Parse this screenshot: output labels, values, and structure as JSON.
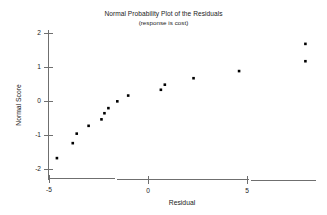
{
  "chart_data": {
    "type": "scatter",
    "title": "Normal Probability Plot of the Residuals",
    "subtitle": "(response is cost)",
    "xlabel": "Residual",
    "ylabel": "Normal Score",
    "xlim": [
      -5.6,
      9.0
    ],
    "ylim": [
      -2.15,
      2.15
    ],
    "xticks": [
      -5,
      0,
      5
    ],
    "xtick_labels": [
      "-5",
      "0",
      "5"
    ],
    "yticks": [
      -2,
      -1,
      0,
      1,
      2
    ],
    "ytick_labels": [
      "-2",
      "-1",
      "0",
      "1",
      "2"
    ],
    "grid": false,
    "legend": "none",
    "marker": "square",
    "marker_color": "#000000",
    "axis_color": "#6f6f6f",
    "points": [
      {
        "x": -4.6,
        "y": -1.68
      },
      {
        "x": -3.8,
        "y": -1.24
      },
      {
        "x": -3.6,
        "y": -0.96
      },
      {
        "x": -3.0,
        "y": -0.73
      },
      {
        "x": -2.35,
        "y": -0.54
      },
      {
        "x": -2.2,
        "y": -0.36
      },
      {
        "x": -2.0,
        "y": -0.21
      },
      {
        "x": -1.55,
        "y": -0.01
      },
      {
        "x": -1.0,
        "y": 0.16
      },
      {
        "x": 0.65,
        "y": 0.33
      },
      {
        "x": 0.85,
        "y": 0.48
      },
      {
        "x": 2.3,
        "y": 0.67
      },
      {
        "x": 4.6,
        "y": 0.88
      },
      {
        "x": 7.95,
        "y": 1.17
      },
      {
        "x": 7.95,
        "y": 1.68
      }
    ]
  }
}
